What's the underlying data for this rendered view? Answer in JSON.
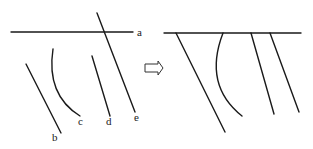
{
  "diagram": {
    "left_panel": {
      "labels": {
        "a": "a",
        "b": "b",
        "c": "c",
        "d": "d",
        "e": "e"
      }
    },
    "arrow": {
      "direction": "right",
      "style": "hollow block arrow"
    },
    "right_panel": {
      "labels": []
    },
    "colors": {
      "stroke": "#1a1a1a",
      "background": "#ffffff"
    }
  }
}
